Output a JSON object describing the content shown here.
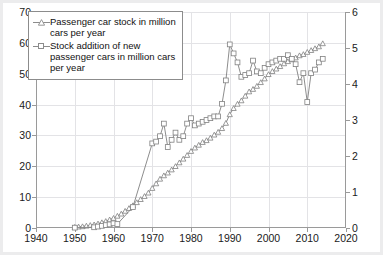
{
  "chart_data": {
    "type": "line",
    "title": "",
    "subtitle": "",
    "xlabel": "",
    "ylabel": "",
    "y2label": "",
    "xlim": [
      1940,
      2020
    ],
    "ylim": [
      0,
      70
    ],
    "y2lim": [
      0,
      6
    ],
    "x_ticks": [
      1940,
      1950,
      1960,
      1970,
      1980,
      1990,
      2000,
      2010,
      2020
    ],
    "y_ticks": [
      0,
      10,
      20,
      30,
      40,
      50,
      60,
      70
    ],
    "y2_ticks": [
      0,
      1,
      2,
      3,
      4,
      5,
      6
    ],
    "grid": true,
    "legend_position": "top-left",
    "series": [
      {
        "name": "Passenger car stock in million cars per year",
        "axis": "left",
        "marker": "triangle",
        "color": "#808080",
        "x": [
          1950,
          1951,
          1952,
          1953,
          1954,
          1955,
          1956,
          1957,
          1958,
          1959,
          1960,
          1961,
          1962,
          1963,
          1964,
          1965,
          1966,
          1967,
          1968,
          1969,
          1970,
          1971,
          1972,
          1973,
          1974,
          1975,
          1976,
          1977,
          1978,
          1979,
          1980,
          1981,
          1982,
          1983,
          1984,
          1985,
          1986,
          1987,
          1988,
          1989,
          1990,
          1991,
          1992,
          1993,
          1994,
          1995,
          1996,
          1997,
          1998,
          1999,
          2000,
          2001,
          2002,
          2003,
          2004,
          2005,
          2006,
          2007,
          2008,
          2009,
          2010,
          2011,
          2012,
          2013,
          2014
        ],
        "values": [
          0.3,
          0.4,
          0.5,
          0.7,
          0.9,
          1.1,
          1.4,
          1.8,
          2.2,
          2.7,
          3.2,
          3.9,
          4.6,
          5.5,
          6.4,
          7.3,
          8.3,
          9.3,
          10.3,
          11.4,
          12.9,
          14.4,
          15.9,
          17.0,
          17.9,
          18.9,
          20.0,
          21.2,
          22.4,
          23.6,
          24.9,
          26.0,
          26.9,
          27.8,
          28.4,
          29.2,
          30.2,
          31.1,
          32.3,
          34.0,
          36.8,
          38.8,
          40.2,
          41.3,
          42.8,
          44.2,
          45.0,
          46.0,
          47.2,
          48.4,
          49.8,
          50.8,
          51.6,
          52.4,
          53.3,
          54.0,
          54.6,
          55.2,
          55.9,
          56.3,
          57.0,
          57.6,
          58.2,
          58.8,
          59.8
        ]
      },
      {
        "name": "Stock addition of new passenger cars in million cars per year",
        "axis": "right",
        "marker": "square",
        "color": "#808080",
        "x": [
          1950,
          1955,
          1956,
          1957,
          1958,
          1959,
          1960,
          1961,
          1965,
          1970,
          1971,
          1972,
          1973,
          1974,
          1975,
          1976,
          1977,
          1978,
          1979,
          1980,
          1981,
          1982,
          1983,
          1984,
          1985,
          1986,
          1987,
          1988,
          1989,
          1990,
          1991,
          1992,
          1993,
          1994,
          1995,
          1996,
          1997,
          1998,
          1999,
          2000,
          2001,
          2002,
          2003,
          2004,
          2005,
          2006,
          2007,
          2008,
          2009,
          2010,
          2011,
          2012,
          2013,
          2014
        ],
        "values": [
          0.01,
          0.02,
          0.04,
          0.06,
          0.08,
          0.1,
          0.13,
          0.11,
          0.58,
          2.35,
          2.4,
          2.55,
          2.9,
          2.25,
          2.45,
          2.65,
          2.45,
          2.55,
          2.9,
          3.05,
          2.85,
          2.9,
          2.95,
          3.0,
          3.05,
          3.1,
          3.1,
          3.45,
          4.1,
          5.1,
          4.85,
          4.6,
          4.2,
          4.25,
          4.3,
          4.65,
          4.35,
          4.3,
          4.45,
          4.55,
          4.6,
          4.65,
          4.7,
          4.7,
          4.8,
          4.7,
          4.55,
          4.05,
          4.3,
          3.5,
          4.3,
          4.4,
          4.6,
          4.7
        ]
      }
    ]
  },
  "legend": {
    "items": [
      {
        "marker": "triangle",
        "label": "Passenger car stock in million cars per year"
      },
      {
        "marker": "square",
        "label": "Stock addition of new passenger cars in million cars per year"
      }
    ]
  },
  "colors": {
    "series_line": "#808080",
    "axis": "#9a9a9a",
    "grid": "#e3e3e6",
    "text": "#1a1a1a",
    "plot_background": "#ffffff",
    "page_background": "#e9e9e9"
  }
}
